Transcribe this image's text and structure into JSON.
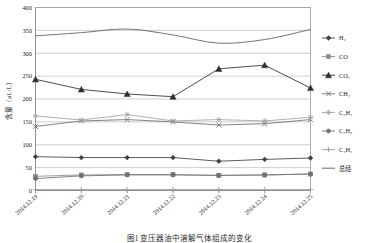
{
  "chart_data": {
    "type": "line",
    "title": "",
    "xlabel": "",
    "ylabel": "含量（μL/L）",
    "ylim": [
      0,
      400
    ],
    "ytick_step": 50,
    "grid": true,
    "legend_position": "right",
    "categories": [
      "2014.12.19",
      "2014.12.20",
      "2014.12.21",
      "2014.12.22",
      "2014.12.23",
      "2014.12.24",
      "2014.12.25"
    ],
    "yticks": [
      "0",
      "50",
      "100",
      "150",
      "200",
      "250",
      "300",
      "350",
      "400"
    ],
    "series": [
      {
        "name": "H₂",
        "label": "H2",
        "marker": "diamond",
        "color": "#3f3f3f",
        "values": [
          74,
          72,
          72,
          72,
          64,
          68,
          71
        ]
      },
      {
        "name": "CO",
        "label": "CO",
        "marker": "square",
        "color": "#8a8a8a",
        "values": [
          31,
          34,
          35,
          35,
          33,
          34,
          36
        ]
      },
      {
        "name": "CO₂",
        "label": "CO2",
        "marker": "triangle",
        "color": "#2e2e2e",
        "values": [
          243,
          221,
          211,
          205,
          266,
          274,
          224
        ]
      },
      {
        "name": "CH₄",
        "label": "CH4",
        "marker": "cross",
        "color": "#6d6d6d",
        "values": [
          140,
          152,
          155,
          150,
          143,
          146,
          155
        ]
      },
      {
        "name": "C₂H₄",
        "label": "C2H4",
        "marker": "star",
        "color": "#a0a0a0",
        "values": [
          163,
          154,
          166,
          152,
          155,
          152,
          160
        ]
      },
      {
        "name": "C₂H₆",
        "label": "C2H6",
        "marker": "circle",
        "color": "#707070",
        "values": [
          26,
          32,
          34,
          34,
          33,
          34,
          36
        ]
      },
      {
        "name": "C₂H₂",
        "label": "C2H2",
        "marker": "plus",
        "color": "#9c9c9c",
        "values": [
          2,
          2,
          2,
          2,
          2,
          2,
          2
        ]
      },
      {
        "name": "总烃",
        "label": "总烃",
        "marker": "none",
        "color": "#5a5a5a",
        "values": [
          338,
          345,
          353,
          340,
          322,
          330,
          352
        ],
        "smooth": true
      }
    ]
  },
  "caption": {
    "text": "图1  变压器油中溶解气体组成的变化"
  }
}
